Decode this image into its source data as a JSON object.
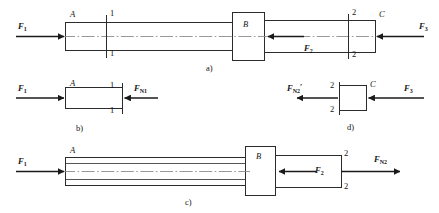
{
  "figure": {
    "kind": "engineering-mechanics-axial-loading-diagram",
    "panels": [
      {
        "id": "a",
        "caption": "a)",
        "description": "stepped bar ABC with applied forces and two cut sections",
        "point_labels": [
          "A",
          "B",
          "C"
        ],
        "section_labels": [
          "1",
          "1",
          "2",
          "2"
        ],
        "forces": [
          {
            "name": "F1",
            "label": "F",
            "sub": "1",
            "direction": "right"
          },
          {
            "name": "F2",
            "label": "F",
            "sub": "2",
            "direction": "left"
          },
          {
            "name": "F3",
            "label": "F",
            "sub": "3",
            "direction": "left"
          }
        ]
      },
      {
        "id": "b",
        "caption": "b)",
        "description": "free body of left segment cut at section 1-1",
        "point_labels": [
          "A"
        ],
        "section_labels": [
          "1",
          "1"
        ],
        "forces": [
          {
            "name": "F1",
            "label": "F",
            "sub": "1",
            "direction": "right"
          },
          {
            "name": "FN1",
            "label": "F",
            "sub": "N1",
            "direction": "left"
          }
        ]
      },
      {
        "id": "c",
        "caption": "c)",
        "description": "free body of segment ABC cut at section 2-2",
        "point_labels": [
          "A",
          "B"
        ],
        "section_labels": [
          "2",
          "2"
        ],
        "forces": [
          {
            "name": "F1",
            "label": "F",
            "sub": "1",
            "direction": "right"
          },
          {
            "name": "F2",
            "label": "F",
            "sub": "2",
            "direction": "left"
          },
          {
            "name": "FN2",
            "label": "F",
            "sub": "N2",
            "direction": "right"
          }
        ]
      },
      {
        "id": "d",
        "caption": "d)",
        "description": "free body of right segment cut at section 2-2",
        "point_labels": [
          "C"
        ],
        "section_labels": [
          "2",
          "2"
        ],
        "forces": [
          {
            "name": "FN2prime",
            "label": "F",
            "sub": "N2",
            "prime": "′",
            "direction": "left"
          },
          {
            "name": "F3",
            "label": "F",
            "sub": "3",
            "direction": "left"
          }
        ]
      }
    ],
    "text": {
      "F": "F",
      "sub_1": "1",
      "sub_2": "2",
      "sub_3": "3",
      "sub_N1": "N1",
      "sub_N2": "N2",
      "prime": "′",
      "A": "A",
      "B": "B",
      "C": "C",
      "sec1": "1",
      "sec2": "2",
      "cap_a": "a)",
      "cap_b": "b)",
      "cap_c": "c)",
      "cap_d": "d)"
    },
    "colors": {
      "background": "#ffffff",
      "stroke": "#2b2b2b",
      "arrow": "#1a1a1a",
      "centerline": "#8c8c8c",
      "text": "#141414"
    }
  }
}
